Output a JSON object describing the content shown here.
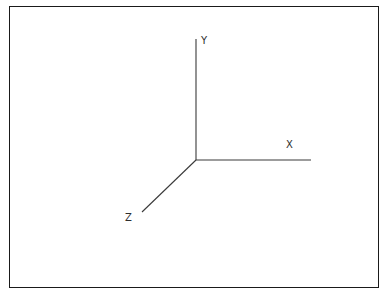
{
  "figure": {
    "kind": "3d-coordinate-axes-diagram",
    "background_color": "#ffffff",
    "frame": {
      "border_color": "#1a1a1a",
      "border_width_px": 1,
      "x": 9,
      "y": 6,
      "width": 370,
      "height": 282
    },
    "origin": {
      "x": 196,
      "y": 160
    },
    "line_color": "#3a3a3a",
    "label_color": "#2e2e2e",
    "axes": [
      {
        "name": "y-axis",
        "label": "Y",
        "direction": "up",
        "start": {
          "x": 196,
          "y": 160
        },
        "end": {
          "x": 196,
          "y": 39
        },
        "label_pos": {
          "x": 201,
          "y": 36
        }
      },
      {
        "name": "x-axis",
        "label": "X",
        "direction": "right",
        "start": {
          "x": 196,
          "y": 160
        },
        "end": {
          "x": 311,
          "y": 160
        },
        "label_pos": {
          "x": 286,
          "y": 140
        }
      },
      {
        "name": "z-axis",
        "label": "Z",
        "direction": "down-left",
        "start": {
          "x": 196,
          "y": 160
        },
        "end": {
          "x": 142,
          "y": 212
        },
        "label_pos": {
          "x": 125,
          "y": 213
        }
      }
    ]
  }
}
